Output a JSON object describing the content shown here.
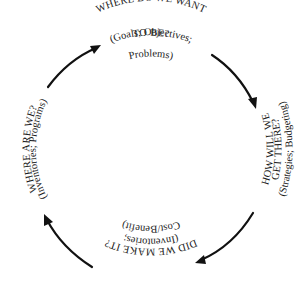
{
  "diagram": {
    "type": "cycle",
    "direction": "clockwise",
    "stages": [
      {
        "position": "top",
        "title_line1": "WHERE DO WE WANT",
        "title_line2": "TO BE?",
        "sub_line1": "(Goals; Objectives;",
        "sub_line2": "Problems)"
      },
      {
        "position": "right",
        "title_line1": "HOW WILL WE",
        "title_line2": "GET THERE?",
        "sub_line1": "(Strategies; Budgeting)"
      },
      {
        "position": "bottom",
        "title_line1": "DID WE MAKE IT?",
        "sub_line1": "(Inventories;",
        "sub_line2": "Cost/Benefit)"
      },
      {
        "position": "left",
        "title_line1": "WHERE ARE WE?",
        "sub_line1": "(Inventories; Programs)"
      }
    ],
    "arrows": [
      {
        "from": "left",
        "to": "top"
      },
      {
        "from": "top",
        "to": "right"
      },
      {
        "from": "right",
        "to": "bottom"
      },
      {
        "from": "bottom",
        "to": "left"
      }
    ],
    "colors": {
      "ink": "#1a1a1a",
      "background": "#ffffff"
    }
  }
}
